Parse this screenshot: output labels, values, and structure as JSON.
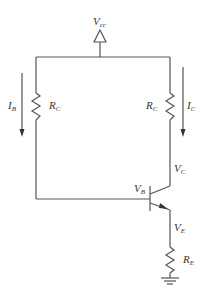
{
  "diagram": {
    "type": "bjt-circuit",
    "supply": {
      "main": "V",
      "sub": "cc"
    },
    "labels": {
      "ib": {
        "main": "I",
        "sub": "B"
      },
      "rc_left": {
        "main": "R",
        "sub": "C"
      },
      "rc_right": {
        "main": "R",
        "sub": "C"
      },
      "ic": {
        "main": "I",
        "sub": "C"
      },
      "vc": {
        "main": "V",
        "sub": "C"
      },
      "vb": {
        "main": "V",
        "sub": "B"
      },
      "ve": {
        "main": "V",
        "sub": "E"
      },
      "re": {
        "main": "R",
        "sub": "E"
      }
    },
    "components": [
      "supply-vcc",
      "resistor-rc-left",
      "resistor-rc-right",
      "npn-transistor",
      "resistor-re",
      "ground"
    ],
    "colors": {
      "wire": "#555555",
      "text": "#333333",
      "background": "#ffffff"
    }
  }
}
